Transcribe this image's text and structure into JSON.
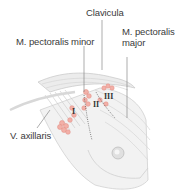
{
  "diagram": {
    "labels": {
      "clavicula": "Clavicula",
      "pectoralis_minor": "M. pectoralis minor",
      "pectoralis_major_line1": "M. pectoralis",
      "pectoralis_major_line2": "major",
      "v_axillaris": "V. axillaris"
    },
    "levels": [
      "I",
      "II",
      "III"
    ],
    "colors": {
      "lymph_node": "#f0a8a0",
      "muscle": "#e4e4e4",
      "outline": "#c8c8c8",
      "leader": "#777777"
    }
  }
}
